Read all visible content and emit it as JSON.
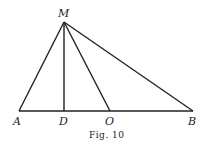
{
  "figure": {
    "caption": "Fig. 10",
    "points": {
      "M": {
        "label": "M",
        "x": 64,
        "y": 22
      },
      "A": {
        "label": "A",
        "x": 19,
        "y": 111
      },
      "D": {
        "label": "D",
        "x": 64,
        "y": 111
      },
      "O": {
        "label": "O",
        "x": 110,
        "y": 111
      },
      "B": {
        "label": "B",
        "x": 193,
        "y": 111
      }
    },
    "segments": [
      [
        "A",
        "B"
      ],
      [
        "M",
        "A"
      ],
      [
        "M",
        "D"
      ],
      [
        "M",
        "O"
      ],
      [
        "M",
        "B"
      ]
    ]
  }
}
